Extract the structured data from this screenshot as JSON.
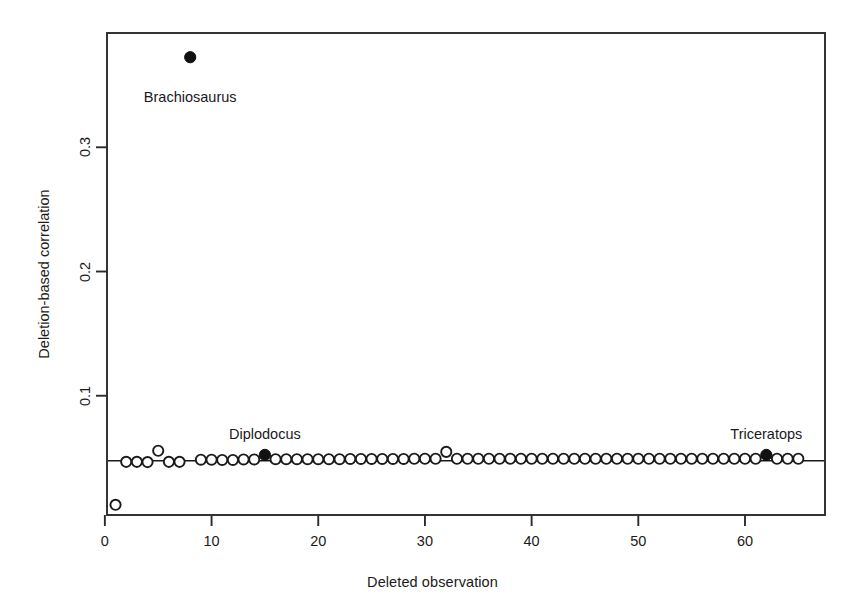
{
  "chart_data": {
    "type": "scatter",
    "title": "",
    "xlabel": "Deleted observation",
    "ylabel": "Deletion-based correlation",
    "xlim": [
      0.2,
      67.5
    ],
    "ylim": [
      0.004,
      0.392
    ],
    "xticks": [
      0,
      10,
      20,
      30,
      40,
      50,
      60
    ],
    "xtick_labels": [
      "0",
      "10",
      "20",
      "30",
      "40",
      "50",
      "60"
    ],
    "yticks": [
      0.1,
      0.2,
      0.3
    ],
    "ytick_labels": [
      "0.1",
      "0.2",
      "0.3"
    ],
    "grid": false,
    "legend": null,
    "reference_line": {
      "type": "horizontal",
      "y": 0.0477,
      "label": ""
    },
    "series": [
      {
        "name": "Deletion-based correlation (open)",
        "marker": "open-circle",
        "x": [
          1,
          2,
          3,
          4,
          5,
          6,
          7,
          9,
          10,
          11,
          12,
          13,
          14,
          16,
          17,
          18,
          19,
          20,
          21,
          22,
          23,
          24,
          25,
          26,
          27,
          28,
          29,
          30,
          31,
          32,
          33,
          34,
          35,
          36,
          37,
          38,
          39,
          40,
          41,
          42,
          43,
          44,
          45,
          46,
          47,
          48,
          49,
          50,
          51,
          52,
          53,
          54,
          55,
          56,
          57,
          58,
          59,
          60,
          61,
          63,
          64,
          65
        ],
        "y": [
          0.0122,
          0.0468,
          0.0468,
          0.0466,
          0.0557,
          0.0468,
          0.0468,
          0.0485,
          0.0485,
          0.0483,
          0.0483,
          0.0487,
          0.0487,
          0.0489,
          0.0489,
          0.0489,
          0.0489,
          0.0489,
          0.0489,
          0.0489,
          0.0491,
          0.0491,
          0.0491,
          0.0491,
          0.0491,
          0.0491,
          0.0493,
          0.0493,
          0.0493,
          0.0548,
          0.0493,
          0.0493,
          0.0493,
          0.0493,
          0.0493,
          0.0493,
          0.0493,
          0.0493,
          0.0493,
          0.0493,
          0.0493,
          0.0493,
          0.0493,
          0.0493,
          0.0493,
          0.0493,
          0.0493,
          0.0493,
          0.0493,
          0.0493,
          0.0493,
          0.0493,
          0.0493,
          0.0493,
          0.0493,
          0.0493,
          0.0493,
          0.0493,
          0.0493,
          0.0493,
          0.0493,
          0.0493
        ]
      },
      {
        "name": "Highlighted taxa (filled)",
        "marker": "filled-circle",
        "x": [
          8,
          15,
          62
        ],
        "y": [
          0.3725,
          0.0524,
          0.0524
        ]
      }
    ],
    "annotations": [
      {
        "text": "Brachiosaurus",
        "x": 8,
        "y": 0.3725,
        "dx": 0,
        "dy": -0.033,
        "anchor": "middle"
      },
      {
        "text": "Diplodocus",
        "x": 15,
        "y": 0.0524,
        "dx": 0,
        "dy": 0.016,
        "anchor": "middle"
      },
      {
        "text": "Triceratops",
        "x": 62,
        "y": 0.0524,
        "dx": 0,
        "dy": 0.016,
        "anchor": "middle"
      }
    ],
    "colors": {
      "axis": "#2b2b2b",
      "marker_stroke": "#1a1a1a",
      "marker_fill_open": "#ffffff",
      "marker_fill_solid": "#111111",
      "background": "#ffffff",
      "text": "#1a1a1a"
    }
  }
}
